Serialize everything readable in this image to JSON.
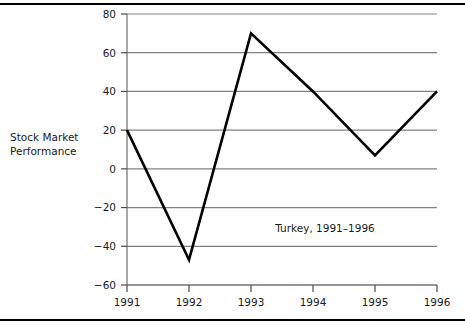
{
  "figure": {
    "y_axis_caption": "Stock Market\nPerformance",
    "rule_color": "#000000"
  },
  "chart_data": {
    "type": "line",
    "title": "",
    "annotation": "Turkey, 1991–1996",
    "xlabel": "",
    "ylabel": "Stock Market Performance",
    "categories": [
      "1991",
      "1992",
      "1993",
      "1994",
      "1995",
      "1996"
    ],
    "x": [
      1991,
      1992,
      1993,
      1994,
      1995,
      1996
    ],
    "values": [
      20,
      -47,
      70,
      40,
      7,
      40
    ],
    "series": [
      {
        "name": "Turkey",
        "values": [
          20,
          -47,
          70,
          40,
          7,
          40
        ]
      }
    ],
    "xlim": [
      1991,
      1996
    ],
    "ylim": [
      -60,
      80
    ],
    "yticks": [
      80,
      60,
      40,
      20,
      0,
      -20,
      -40,
      -60
    ],
    "ytick_labels": [
      "80",
      "60",
      "40",
      "20",
      "0",
      "−20",
      "−40",
      "−60"
    ],
    "xticks": [
      1991,
      1992,
      1993,
      1994,
      1995,
      1996
    ],
    "xtick_labels": [
      "1991",
      "1992",
      "1993",
      "1994",
      "1995",
      "1996"
    ],
    "grid": true,
    "grid_axis": "y",
    "grid_color": "#808080",
    "line_color": "#000000",
    "line_width": 2.6,
    "legend": false,
    "legend_position": "none",
    "markers": false
  }
}
